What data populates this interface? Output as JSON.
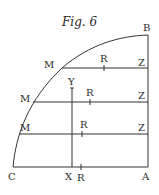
{
  "figure": {
    "title": "Fig. 6",
    "labels": {
      "B": "B",
      "C": "C",
      "A": "A",
      "X": "X",
      "Y": "Y",
      "R_bottom": "R",
      "M1": "M",
      "R1": "R",
      "Z1": "Z",
      "M2": "M",
      "R2": "R",
      "Z2": "Z",
      "M3": "M",
      "R3": "R",
      "Z3": "Z"
    },
    "stroke_color": "#333333",
    "background": "#ffffff"
  }
}
